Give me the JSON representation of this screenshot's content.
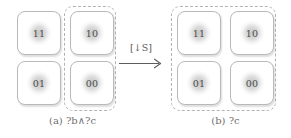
{
  "figure": {
    "panels": [
      {
        "id": "panel-a",
        "caption_tag": "(a)",
        "caption_expr": "?b∧?c",
        "caption_full": "(a) ?b∧?c",
        "selection": "right-column",
        "cells": [
          {
            "label": "11",
            "selected": false
          },
          {
            "label": "10",
            "selected": true
          },
          {
            "label": "01",
            "selected": false
          },
          {
            "label": "00",
            "selected": true
          }
        ]
      },
      {
        "id": "panel-b",
        "caption_tag": "(b)",
        "caption_expr": "?c",
        "caption_full": "(b) ?c",
        "selection": "all",
        "cells": [
          {
            "label": "11",
            "selected": true
          },
          {
            "label": "10",
            "selected": true
          },
          {
            "label": "01",
            "selected": true
          },
          {
            "label": "00",
            "selected": true
          }
        ]
      }
    ],
    "transition": {
      "label": "[↓S]",
      "label_bracket_open": "[",
      "label_arrow": "↓",
      "label_symbol": "S",
      "label_bracket_close": "]",
      "arrow_glyph": "⟶",
      "direction": "left-to-right"
    },
    "colors": {
      "background": "#ffffff",
      "cell_border": "#b9b9b9",
      "cell_fill": "#ffffff",
      "blob": "#969696",
      "dashed_border": "#b3b3b3",
      "text": "#4a4a4a",
      "caption_text": "#6e6e6e",
      "arrow": "#5d5d5d"
    }
  }
}
